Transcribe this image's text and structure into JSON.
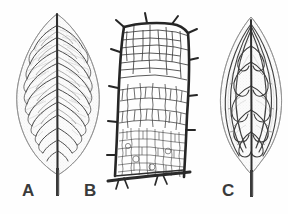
{
  "figure": {
    "kind": "botanical-illustration",
    "background_color": "#fefefe",
    "ink_color": "#2b2b2b",
    "blade_fill_color": "#f4f4f4",
    "faint_vein_color": "#b9b9b9",
    "panel_count": 3
  },
  "labels": {
    "a": "A",
    "b": "B",
    "c": "C"
  },
  "panels": [
    {
      "id": "a",
      "label": "A",
      "caption": "A",
      "description": "whole ovate-elliptic leaf with pinnate brochidodromous venation",
      "outline_shape": "ovate-elliptic",
      "apex": "acute",
      "base": "attenuate",
      "midrib": "strong, straight, tapering",
      "secondary_vein_pairs": 11,
      "secondary_vein_angle_deg": 52,
      "venation_type": "pinnate-brochidodromous",
      "has_petiole": true,
      "bounds": {
        "x": 12,
        "y": 11,
        "width": 90,
        "height": 165
      }
    },
    {
      "id": "b",
      "label": "B",
      "caption": "B",
      "description": "enlarged detail of areolate reticulate venation bounded by thick border veins with short spurs",
      "venation_type": "areolate-reticulate",
      "border_vein_weight": "thick",
      "areole_size_gradient": "large above, fine below",
      "spur_count": 9,
      "bounds": {
        "x": 112,
        "y": 22,
        "width": 88,
        "height": 160
      }
    },
    {
      "id": "c",
      "label": "C",
      "caption": "C",
      "description": "whole narrow elliptic leaf with arched acrodromous venation converging at apex",
      "outline_shape": "narrow-elliptic",
      "apex": "acute-convergent",
      "base": "attenuate",
      "midrib": "strong, straight",
      "arch_vein_pairs": 5,
      "venation_type": "acrodromous-arched",
      "has_petiole": true,
      "bounds": {
        "x": 218,
        "y": 14,
        "width": 66,
        "height": 162
      }
    }
  ]
}
